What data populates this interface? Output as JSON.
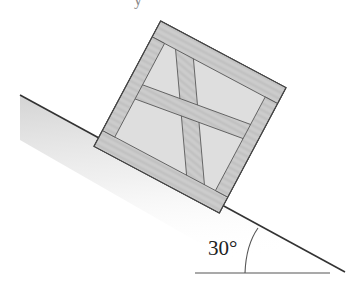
{
  "figure": {
    "type": "physics-diagram",
    "angle_label": "30°",
    "incline_angle_deg": 30,
    "top_cropped_text_fragments": [
      "",
      "y"
    ]
  },
  "colors": {
    "background": "#ffffff",
    "line": "#333333",
    "wood": "#c9c9c9",
    "wood_dark": "#a8a8a8",
    "panel": "#dcdcdc",
    "shadow": "#d0d0d0"
  }
}
